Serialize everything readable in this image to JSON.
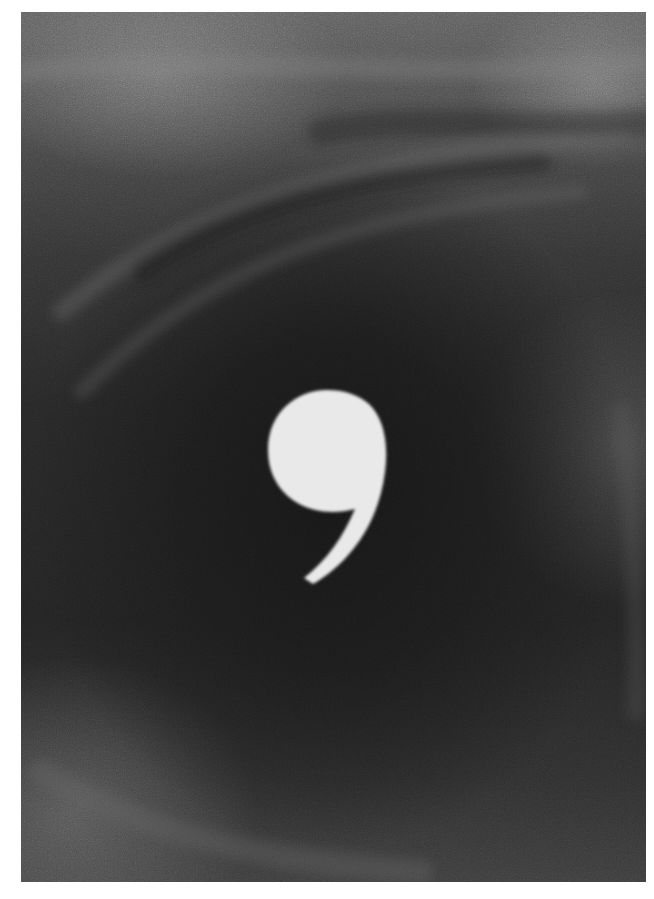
{
  "artwork": {
    "subject": "comma-glyph",
    "medium": "charcoal drawing",
    "background_colors": {
      "paper": "#ffffff",
      "center_dark": "#1a1a1a",
      "top_band": "#5e5e5e",
      "bottom_band": "#3c3c3c"
    },
    "glyph": {
      "character": ",",
      "color": "#e8e8e8",
      "position": {
        "cx": 327,
        "cy": 450,
        "head_radius": 60
      }
    }
  },
  "caption": {
    "text": ""
  }
}
